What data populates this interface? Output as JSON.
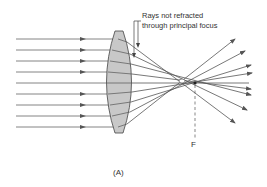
{
  "figure": {
    "caption_line1": "Rays not refracted",
    "caption_line2": "through principal focus",
    "focus_label": "F",
    "panel_label": "(A)"
  },
  "colors": {
    "ray": "#555555",
    "lens_fill": "#c8c8c8",
    "lens_stroke": "#444444",
    "text": "#333333"
  },
  "diagram": {
    "incoming_ray_y": [
      39,
      50,
      61,
      72,
      83,
      94,
      105,
      116,
      127
    ],
    "lens": {
      "top": 31,
      "bottom": 133,
      "left": 107,
      "right": 132
    },
    "focus_point": {
      "x": 195,
      "y": 83
    }
  }
}
